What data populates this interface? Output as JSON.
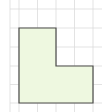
{
  "figure": {
    "label": "(b)",
    "visible_label_fragment": ")",
    "grid": {
      "vertical_lines_x": [
        10,
        19,
        37.5,
        56,
        74.5,
        93
      ],
      "horizontal_lines_y": [
        9,
        28,
        47,
        66,
        84.5,
        103
      ],
      "x_start": 10,
      "x_end": 102,
      "y_start": 0,
      "y_end": 112,
      "color": "#dcdcdc"
    },
    "shape": {
      "type": "L-shape",
      "points": "19,28 56,28 56,66 93,66 93,103 19,103",
      "fill": "#eef8e0",
      "stroke": "#4a4a48",
      "width_units": 4,
      "height_units": 4,
      "notch_units": "2x2 removed from top-right"
    }
  }
}
